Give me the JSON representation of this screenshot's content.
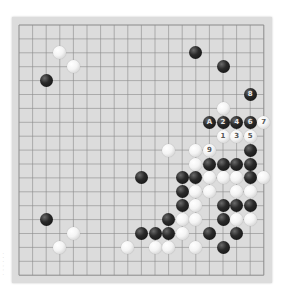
{
  "board": {
    "size": 19,
    "origin_x": 19,
    "origin_y": 25,
    "spacing_x": 13.6,
    "spacing_y": 13.9,
    "colors": {
      "board": "#dcdcdc",
      "line": "#8a8a8a",
      "black": "#111111",
      "white": "#f4f4f4"
    }
  },
  "stones": {
    "black": [
      {
        "col": 2,
        "row": 4,
        "label": ""
      },
      {
        "col": 13,
        "row": 2,
        "label": ""
      },
      {
        "col": 15,
        "row": 3,
        "label": ""
      },
      {
        "col": 17,
        "row": 5,
        "label": "8"
      },
      {
        "col": 14,
        "row": 7,
        "label": "A"
      },
      {
        "col": 15,
        "row": 7,
        "label": "2"
      },
      {
        "col": 16,
        "row": 7,
        "label": "4"
      },
      {
        "col": 17,
        "row": 7,
        "label": "6"
      },
      {
        "col": 17,
        "row": 9,
        "label": ""
      },
      {
        "col": 14,
        "row": 10,
        "label": ""
      },
      {
        "col": 15,
        "row": 10,
        "label": ""
      },
      {
        "col": 16,
        "row": 10,
        "label": ""
      },
      {
        "col": 17,
        "row": 10,
        "label": ""
      },
      {
        "col": 9,
        "row": 11,
        "label": ""
      },
      {
        "col": 12,
        "row": 11,
        "label": ""
      },
      {
        "col": 13,
        "row": 11,
        "label": ""
      },
      {
        "col": 17,
        "row": 11,
        "label": ""
      },
      {
        "col": 12,
        "row": 12,
        "label": ""
      },
      {
        "col": 12,
        "row": 13,
        "label": ""
      },
      {
        "col": 15,
        "row": 13,
        "label": ""
      },
      {
        "col": 16,
        "row": 13,
        "label": ""
      },
      {
        "col": 17,
        "row": 13,
        "label": ""
      },
      {
        "col": 2,
        "row": 14,
        "label": ""
      },
      {
        "col": 11,
        "row": 14,
        "label": ""
      },
      {
        "col": 15,
        "row": 14,
        "label": ""
      },
      {
        "col": 9,
        "row": 15,
        "label": ""
      },
      {
        "col": 10,
        "row": 15,
        "label": ""
      },
      {
        "col": 11,
        "row": 15,
        "label": ""
      },
      {
        "col": 14,
        "row": 15,
        "label": ""
      },
      {
        "col": 16,
        "row": 15,
        "label": ""
      },
      {
        "col": 15,
        "row": 16,
        "label": ""
      }
    ],
    "white": [
      {
        "col": 3,
        "row": 2,
        "label": ""
      },
      {
        "col": 4,
        "row": 3,
        "label": ""
      },
      {
        "col": 15,
        "row": 6,
        "label": ""
      },
      {
        "col": 18,
        "row": 7,
        "label": "7"
      },
      {
        "col": 15,
        "row": 8,
        "label": "1"
      },
      {
        "col": 16,
        "row": 8,
        "label": "3"
      },
      {
        "col": 17,
        "row": 8,
        "label": "5"
      },
      {
        "col": 11,
        "row": 9,
        "label": ""
      },
      {
        "col": 13,
        "row": 9,
        "label": ""
      },
      {
        "col": 14,
        "row": 9,
        "label": "9"
      },
      {
        "col": 13,
        "row": 10,
        "label": ""
      },
      {
        "col": 14,
        "row": 11,
        "label": ""
      },
      {
        "col": 15,
        "row": 11,
        "label": ""
      },
      {
        "col": 16,
        "row": 11,
        "label": ""
      },
      {
        "col": 18,
        "row": 11,
        "label": ""
      },
      {
        "col": 13,
        "row": 12,
        "label": ""
      },
      {
        "col": 14,
        "row": 12,
        "label": ""
      },
      {
        "col": 16,
        "row": 12,
        "label": ""
      },
      {
        "col": 17,
        "row": 12,
        "label": ""
      },
      {
        "col": 13,
        "row": 13,
        "label": ""
      },
      {
        "col": 12,
        "row": 14,
        "label": ""
      },
      {
        "col": 13,
        "row": 14,
        "label": ""
      },
      {
        "col": 16,
        "row": 14,
        "label": ""
      },
      {
        "col": 17,
        "row": 14,
        "label": ""
      },
      {
        "col": 4,
        "row": 15,
        "label": ""
      },
      {
        "col": 12,
        "row": 15,
        "label": ""
      },
      {
        "col": 3,
        "row": 16,
        "label": ""
      },
      {
        "col": 8,
        "row": 16,
        "label": ""
      },
      {
        "col": 10,
        "row": 16,
        "label": ""
      },
      {
        "col": 11,
        "row": 16,
        "label": ""
      },
      {
        "col": 13,
        "row": 16,
        "label": ""
      }
    ]
  },
  "watermark": {
    "text": "· · · · · ·"
  }
}
